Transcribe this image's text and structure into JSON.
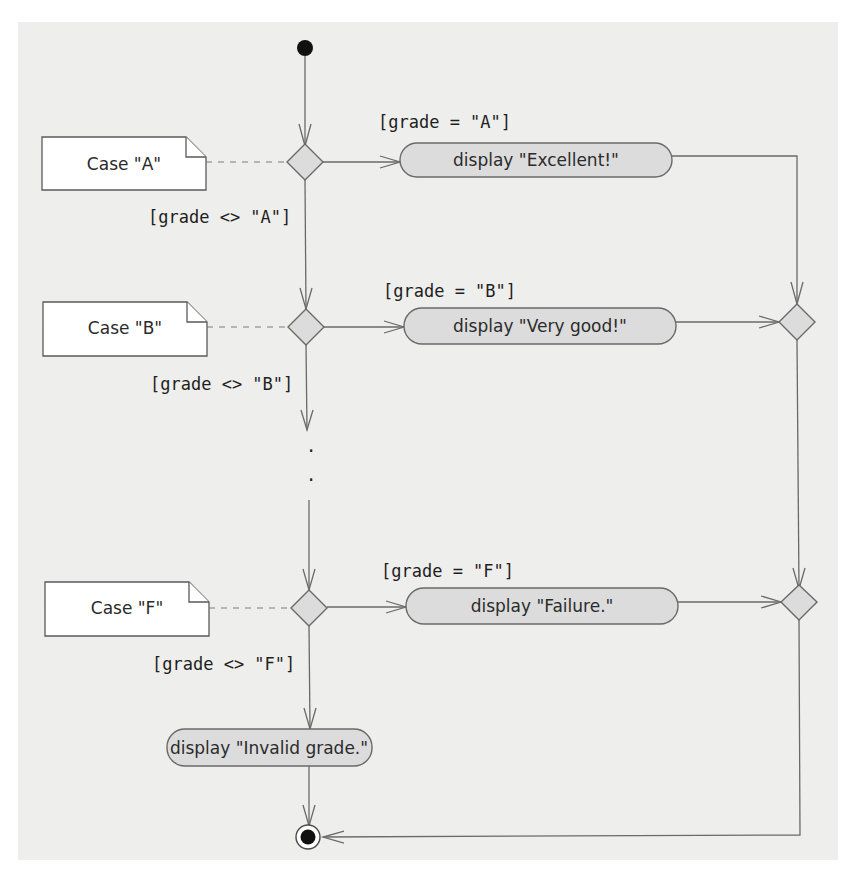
{
  "diagram": {
    "type": "UML activity diagram",
    "colors": {
      "panel": "#eeeeec",
      "node_fill": "#dcdcdc",
      "stroke": "#6a6a6a",
      "note_fill": "#ffffff",
      "initial": "#111111"
    },
    "initial_node": {
      "x": 305,
      "y": 48
    },
    "final_node": {
      "x": 307,
      "y": 838
    },
    "ellipsis": [
      ".",
      "."
    ],
    "cases": [
      {
        "note": "Case \"A\"",
        "guard_true": "[grade = \"A\"]",
        "guard_false": "[grade <> \"A\"]",
        "action": "display \"Excellent!\""
      },
      {
        "note": "Case \"B\"",
        "guard_true": "[grade = \"B\"]",
        "guard_false": "[grade <> \"B\"]",
        "action": "display \"Very good!\""
      },
      {
        "note": "Case \"F\"",
        "guard_true": "[grade = \"F\"]",
        "guard_false": "[grade <> \"F\"]",
        "action": "display \"Failure.\""
      }
    ],
    "default_action": "display \"Invalid grade.\""
  }
}
